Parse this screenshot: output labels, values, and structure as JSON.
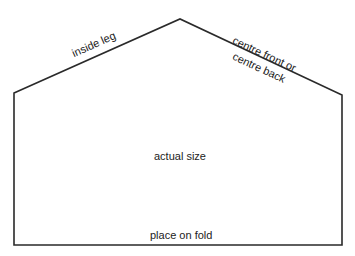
{
  "diagram": {
    "type": "sewing-pattern-piece",
    "stroke_color": "#2a2a2a",
    "background": "#ffffff",
    "shape_points": [
      [
        14,
        93
      ],
      [
        180,
        19
      ],
      [
        342,
        95
      ],
      [
        342,
        245
      ],
      [
        14,
        245
      ]
    ],
    "labels": {
      "inside_leg": "inside leg",
      "centre_line1": "centre front or",
      "centre_line2": "centre back",
      "actual_size": "actual size",
      "place_on_fold": "place on fold"
    }
  }
}
